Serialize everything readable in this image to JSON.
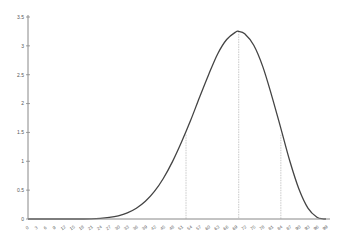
{
  "chart_data": {
    "type": "line",
    "title": "",
    "xlabel": "",
    "ylabel": "",
    "xlim": [
      0,
      99
    ],
    "ylim": [
      0,
      3.5
    ],
    "grid": false,
    "legend": null,
    "y_ticks": [
      0,
      0.5,
      1,
      1.5,
      2,
      2.5,
      3,
      3.5
    ],
    "y_tick_labels": [
      "0",
      "0.5",
      "1",
      "1.5",
      "2",
      "2.5",
      "3",
      "3.5"
    ],
    "x_tick_labels": [
      "0",
      "3",
      "6",
      "9",
      "12",
      "15",
      "18",
      "21",
      "24",
      "27",
      "30",
      "33",
      "36",
      "39",
      "42",
      "45",
      "48",
      "51",
      "54",
      "57",
      "60",
      "63",
      "66",
      "69",
      "72",
      "75",
      "78",
      "81",
      "84",
      "87",
      "90",
      "93",
      "96",
      "99"
    ],
    "series": [
      {
        "name": "density",
        "color": "#444444",
        "x": [
          0,
          3,
          6,
          9,
          12,
          15,
          18,
          21,
          24,
          27,
          30,
          33,
          36,
          39,
          42,
          45,
          48,
          51,
          54,
          57,
          60,
          63,
          66,
          69,
          70,
          72,
          75,
          78,
          81,
          84,
          87,
          90,
          93,
          96,
          98,
          99
        ],
        "y": [
          0,
          0,
          0,
          0,
          0,
          0,
          0,
          0.002,
          0.01,
          0.027,
          0.056,
          0.106,
          0.187,
          0.307,
          0.477,
          0.706,
          0.994,
          1.334,
          1.706,
          2.11,
          2.5,
          2.86,
          3.11,
          3.24,
          3.25,
          3.21,
          3.01,
          2.64,
          2.13,
          1.57,
          1.0,
          0.52,
          0.19,
          0.03,
          0.003,
          0
        ]
      }
    ],
    "annotations": [
      {
        "type": "vline",
        "style": "dotted",
        "x": 52.5,
        "y_top": 1.46,
        "color": "#bbbbbb"
      },
      {
        "type": "vline",
        "style": "dotted",
        "x": 70,
        "y_top": 3.25,
        "color": "#bbbbbb"
      },
      {
        "type": "vline",
        "style": "dotted",
        "x": 84,
        "y_top": 1.46,
        "color": "#bbbbbb"
      }
    ]
  }
}
